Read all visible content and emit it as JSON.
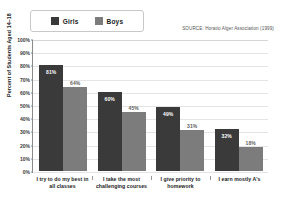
{
  "legend": {
    "entries": [
      {
        "label": "Girls",
        "color": "#3a3a3a",
        "swatch_name": "girls-swatch"
      },
      {
        "label": "Boys",
        "color": "#7c7c7c",
        "swatch_name": "boys-swatch"
      }
    ]
  },
  "source_note": "SOURCE: Horatio Alger Association (1999)",
  "axes": {
    "y_title": "Percent of Students Aged 14–18",
    "y_ticks": [
      "100%",
      "90%",
      "80%",
      "70%",
      "60%",
      "50%",
      "40%",
      "30%",
      "20%",
      "10%",
      "0%"
    ]
  },
  "chart_data": {
    "type": "bar",
    "title": "",
    "subtitle": "",
    "xlabel": "",
    "ylabel": "Percent of Students Aged 14–18",
    "ylim": [
      0,
      100
    ],
    "ytick_values": [
      0,
      10,
      20,
      30,
      40,
      50,
      60,
      70,
      80,
      90,
      100
    ],
    "ytick_labels": [
      "0%",
      "10%",
      "20%",
      "30%",
      "40%",
      "50%",
      "60%",
      "70%",
      "80%",
      "90%",
      "100%"
    ],
    "grid": true,
    "grid_axis": "y",
    "legend_position": "top-left",
    "annotation": "SOURCE: Horatio Alger Association (1999)",
    "categories": [
      "I try to do my best in all classes",
      "I take the most challenging courses",
      "I give priority to homework",
      "I earn mostly A's"
    ],
    "category_lines": [
      [
        "I try to do my best in",
        "all classes"
      ],
      [
        "I take the most",
        "challenging courses"
      ],
      [
        "I give priority to",
        "homework"
      ],
      [
        "I earn mostly A's"
      ]
    ],
    "series": [
      {
        "name": "Girls",
        "color": "#3a3a3a",
        "values": [
          81,
          60,
          49,
          32
        ],
        "labels": [
          "81%",
          "60%",
          "49%",
          "32%"
        ]
      },
      {
        "name": "Boys",
        "color": "#7c7c7c",
        "values": [
          64,
          45,
          31,
          18
        ],
        "labels": [
          "64%",
          "45%",
          "31%",
          "18%"
        ]
      }
    ]
  }
}
